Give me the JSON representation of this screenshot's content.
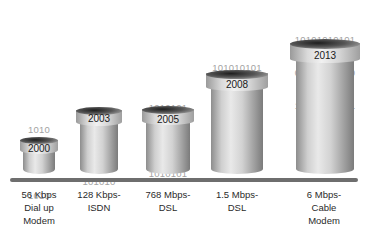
{
  "colors": {
    "bits_text": "#a3a3a3",
    "cylinder_light": "#e9e9e9",
    "cylinder_dark": "#7b7b7b",
    "rim_dark": "#1e1e1e",
    "baseline": "#6e6e6e",
    "label_text": "#2a2a2a"
  },
  "items": [
    {
      "year": "2000",
      "bits": [
        "1010",
        "0101",
        "1010"
      ],
      "label": "56 Kbps\nDial up\nModem"
    },
    {
      "year": "2003",
      "bits": [
        "101010",
        "010101",
        "101010"
      ],
      "label": "128 Kbps-\nISDN"
    },
    {
      "year": "2005",
      "bits": [
        "1010101",
        "0101010",
        "1010101"
      ],
      "label": "768 Mbps-\nDSL"
    },
    {
      "year": "2008",
      "bits": [
        "101010101",
        "010101010",
        "101010101"
      ],
      "label": "1.5 Mbps-\nDSL"
    },
    {
      "year": "2013",
      "bits": [
        "10101010101",
        "01010101010",
        "10101010101"
      ],
      "label": "6 Mbps-\nCable\nModem"
    }
  ]
}
